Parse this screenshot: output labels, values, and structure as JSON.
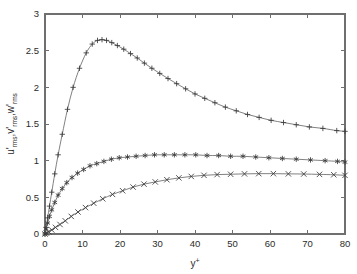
{
  "figure": {
    "background_color": "#ffffff",
    "frame_color": "#6f6f6f",
    "curve_color": "#6a6a6a",
    "marker_color": "#3a3a3a"
  },
  "axes": {
    "x_title": "y",
    "x_title_sup": "+",
    "y_title_parts": [
      {
        "base": "u'",
        "sub": "rms"
      },
      {
        "base": "v'",
        "sub": "rms"
      },
      {
        "base": "w'",
        "sub": "rms"
      }
    ],
    "y_title_plain": "u'rms, v'rms, w'rms",
    "x_ticks": [
      "0",
      "10",
      "20",
      "30",
      "40",
      "50",
      "60",
      "70",
      "80"
    ],
    "y_ticks": [
      "0",
      "0.5",
      "1",
      "1.5",
      "2",
      "2.5",
      "3"
    ]
  },
  "chart_data": {
    "type": "line",
    "title": "",
    "xlabel": "y+",
    "ylabel": "u'_rms, v'_rms, w'_rms",
    "xlim": [
      0,
      80
    ],
    "ylim": [
      0,
      3
    ],
    "xticks": [
      0,
      10,
      20,
      30,
      40,
      50,
      60,
      70,
      80
    ],
    "yticks": [
      0,
      0.5,
      1,
      1.5,
      2,
      2.5,
      3
    ],
    "grid": false,
    "legend": "none",
    "series": [
      {
        "name": "u'_rms",
        "marker": "plus",
        "x": [
          0,
          0.3,
          0.7,
          1.2,
          1.8,
          2.6,
          3.5,
          4.6,
          6.0,
          7.5,
          9.2,
          11.0,
          12.6,
          14.0,
          15.2,
          16.4,
          17.8,
          19.3,
          21.0,
          22.8,
          24.6,
          26.5,
          28.5,
          30.6,
          32.8,
          35.1,
          37.5,
          40.0,
          42.6,
          45.3,
          48.1,
          51.0,
          54.0,
          57.1,
          60.3,
          63.6,
          67.0,
          70.5,
          74.1,
          77.8,
          80.0
        ],
        "y": [
          0.0,
          0.09,
          0.22,
          0.38,
          0.57,
          0.82,
          1.08,
          1.36,
          1.7,
          2.0,
          2.26,
          2.47,
          2.59,
          2.64,
          2.65,
          2.64,
          2.61,
          2.57,
          2.52,
          2.46,
          2.4,
          2.33,
          2.26,
          2.19,
          2.12,
          2.05,
          1.98,
          1.91,
          1.85,
          1.79,
          1.73,
          1.68,
          1.63,
          1.59,
          1.55,
          1.52,
          1.49,
          1.46,
          1.44,
          1.41,
          1.4
        ]
      },
      {
        "name": "w'_rms",
        "marker": "star",
        "x": [
          0,
          0.3,
          0.7,
          1.2,
          1.8,
          2.6,
          3.5,
          4.6,
          5.8,
          7.2,
          8.7,
          10.3,
          12.0,
          13.8,
          15.7,
          17.7,
          19.8,
          22.0,
          24.3,
          26.7,
          29.2,
          31.8,
          34.5,
          37.3,
          40.2,
          43.2,
          46.3,
          49.5,
          52.8,
          56.2,
          59.7,
          63.3,
          67.0,
          70.8,
          74.7,
          78.0,
          80.0
        ],
        "y": [
          0.0,
          0.07,
          0.15,
          0.24,
          0.33,
          0.43,
          0.53,
          0.62,
          0.7,
          0.77,
          0.83,
          0.88,
          0.93,
          0.96,
          0.99,
          1.02,
          1.04,
          1.05,
          1.06,
          1.07,
          1.08,
          1.08,
          1.08,
          1.08,
          1.08,
          1.07,
          1.07,
          1.06,
          1.06,
          1.05,
          1.04,
          1.03,
          1.02,
          1.01,
          1.0,
          0.99,
          0.98
        ]
      },
      {
        "name": "v'_rms",
        "marker": "cross",
        "x": [
          0,
          0.4,
          1.0,
          1.8,
          2.8,
          4.0,
          5.4,
          7.0,
          8.8,
          10.8,
          13.0,
          15.4,
          18.0,
          20.7,
          23.5,
          26.4,
          29.4,
          32.5,
          35.7,
          39.0,
          42.4,
          45.9,
          49.5,
          53.2,
          57.0,
          60.9,
          64.9,
          69.0,
          73.2,
          77.0,
          80.0
        ],
        "y": [
          0.0,
          0.012,
          0.03,
          0.055,
          0.09,
          0.13,
          0.18,
          0.24,
          0.3,
          0.36,
          0.42,
          0.48,
          0.54,
          0.59,
          0.64,
          0.68,
          0.71,
          0.74,
          0.765,
          0.785,
          0.8,
          0.81,
          0.815,
          0.82,
          0.823,
          0.823,
          0.82,
          0.818,
          0.813,
          0.808,
          0.8
        ]
      }
    ]
  }
}
